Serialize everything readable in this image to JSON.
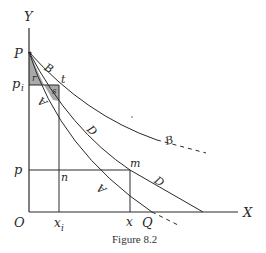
{
  "figure": {
    "caption": "Figure 8.2",
    "axes": {
      "y_label": "Y",
      "x_label": "X",
      "origin_label": "O"
    },
    "points": {
      "P": "P",
      "p_i": "p",
      "p_i_sub": "i",
      "t": "t",
      "p": "p",
      "n": "n",
      "m": "m",
      "x_i": "x",
      "x_i_sub": "i",
      "x": "x",
      "Q": "Q"
    },
    "curves": {
      "B": "B",
      "B_end": "B",
      "D": "D",
      "D_end": "D",
      "A": "A",
      "A_end": "A"
    },
    "shaded_regions": {
      "r": "r",
      "s": "s"
    },
    "colors": {
      "line": "#2a2a2a",
      "shade": "#a9a9a9",
      "background": "#ffffff"
    }
  }
}
